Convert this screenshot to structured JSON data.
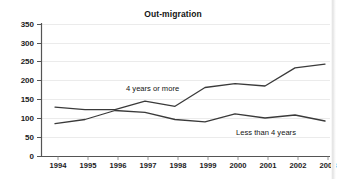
{
  "chart_data": {
    "type": "line",
    "title": "Out-migration",
    "xlabel": "",
    "ylabel": "",
    "x": [
      1994,
      1995,
      1996,
      1997,
      1998,
      1999,
      2000,
      2001,
      2002,
      2003
    ],
    "categories": [
      "1994",
      "1995",
      "1996",
      "1997",
      "1998",
      "1999",
      "2000",
      "2001",
      "2002",
      "2003"
    ],
    "ylim": [
      0,
      350
    ],
    "yticks": [
      0,
      50,
      100,
      150,
      200,
      250,
      300,
      350
    ],
    "ytick_labels": [
      "0",
      "50",
      "100",
      "150",
      "200",
      "250",
      "300",
      "350"
    ],
    "grid": true,
    "legend_position": "inline-annotations",
    "series": [
      {
        "name": "4 years or more",
        "values": [
          131,
          124,
          124,
          147,
          133,
          183,
          193,
          187,
          235,
          245
        ],
        "color": "#3a3a3a"
      },
      {
        "name": "Less than 4 years",
        "values": [
          87,
          98,
          122,
          117,
          98,
          92,
          113,
          102,
          110,
          94
        ],
        "color": "#3a3a3a"
      }
    ],
    "annotations": [
      {
        "text": "4 years or more",
        "x": 1997,
        "y": 205
      },
      {
        "text": "Less than 4 years",
        "x": 2001.3,
        "y": 60
      }
    ]
  },
  "axis": {
    "y_labels": [
      "350",
      "300",
      "250",
      "200",
      "150",
      "100",
      "50",
      "0"
    ],
    "x_labels": [
      "1994",
      "1995",
      "1996",
      "1997",
      "1998",
      "1999",
      "2000",
      "2001",
      "2002",
      "2003"
    ]
  },
  "colors": {
    "line": "#3a3a3a",
    "axis": "#4a4a4a",
    "grid": "#e8e8e8",
    "text": "#1a1a1a",
    "background": "#ffffff"
  }
}
